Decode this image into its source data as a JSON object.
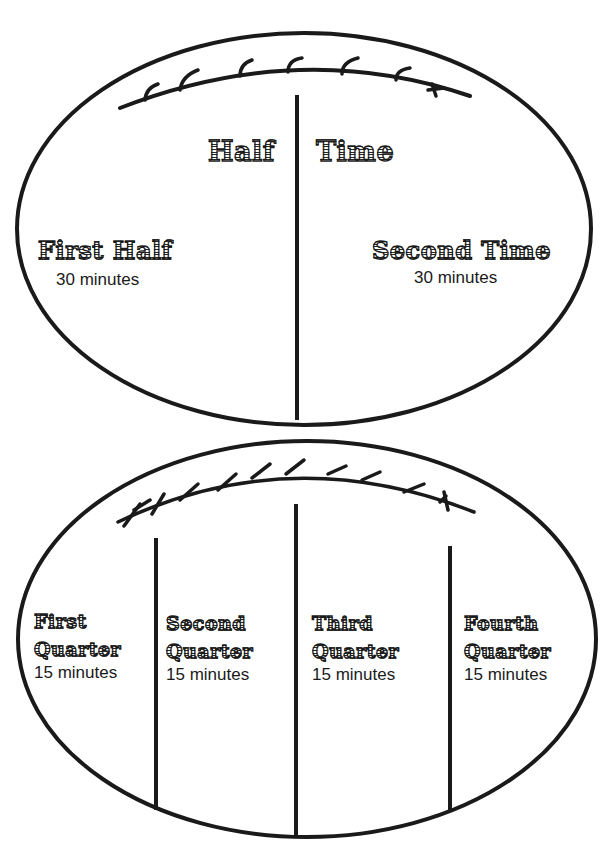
{
  "colors": {
    "ink": "#1a1a1a",
    "paper": "#ffffff"
  },
  "top_ball": {
    "title_left": "Half",
    "title_right": "Time",
    "sections": [
      {
        "title": "First Half",
        "duration": "30 minutes"
      },
      {
        "title": "Second Time",
        "duration": "30 minutes"
      }
    ]
  },
  "bottom_ball": {
    "sections": [
      {
        "title_line1": "First",
        "title_line2": "Quarter",
        "duration": "15 minutes"
      },
      {
        "title_line1": "Second",
        "title_line2": "Quarter",
        "duration": "15 minutes"
      },
      {
        "title_line1": "Third",
        "title_line2": "Quarter",
        "duration": "15 minutes"
      },
      {
        "title_line1": "Fourth",
        "title_line2": "Quarter",
        "duration": "15 minutes"
      }
    ]
  }
}
